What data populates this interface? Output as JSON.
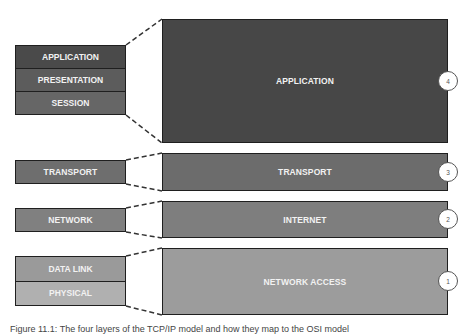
{
  "osi_model": {
    "groups": [
      {
        "layers": [
          {
            "label": "APPLICATION",
            "color": "#4a4a4a"
          },
          {
            "label": "PRESENTATION",
            "color": "#5c5c5c"
          },
          {
            "label": "SESSION",
            "color": "#666666"
          }
        ]
      },
      {
        "layers": [
          {
            "label": "TRANSPORT",
            "color": "#6e6e6e"
          }
        ]
      },
      {
        "layers": [
          {
            "label": "NETWORK",
            "color": "#808080"
          }
        ]
      },
      {
        "layers": [
          {
            "label": "DATA LINK",
            "color": "#9a9a9a"
          },
          {
            "label": "PHYSICAL",
            "color": "#b0b0b0"
          }
        ]
      }
    ]
  },
  "tcpip_model": {
    "layers": [
      {
        "label": "APPLICATION",
        "number": "4",
        "color": "#474747"
      },
      {
        "label": "TRANSPORT",
        "number": "3",
        "color": "#6c6c6c"
      },
      {
        "label": "INTERNET",
        "number": "2",
        "color": "#7e7e7e"
      },
      {
        "label": "NETWORK ACCESS",
        "number": "1",
        "color": "#9c9c9c"
      }
    ]
  },
  "caption": "Figure 11.1: The four layers of the TCP/IP model and how they map to the OSI model"
}
